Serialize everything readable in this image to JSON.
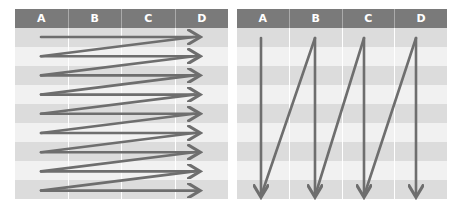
{
  "left_table": {
    "columns": [
      "A",
      "B",
      "C",
      "D"
    ],
    "row_count": 9,
    "arrow_pattern": "row-by-row zigzag (left to right per row)"
  },
  "right_table": {
    "columns": [
      "A",
      "B",
      "C",
      "D"
    ],
    "row_count": 9,
    "arrow_pattern": "column-by-column zigzag (top to bottom per column)"
  },
  "colors": {
    "header": "#7a7a7a",
    "row_shade": "#dcdcdc",
    "row_light": "#f1f1f1",
    "arrow": "#6e6e6e"
  }
}
